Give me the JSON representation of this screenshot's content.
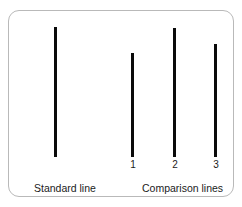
{
  "card": {
    "background_color": "#ffffff",
    "border_color": "#b9b9b9",
    "line_color": "#0a0a0a"
  },
  "standard": {
    "caption": "Standard line",
    "line": {
      "x": 53,
      "top": 26,
      "bottom": 156,
      "height": 130
    }
  },
  "comparison": {
    "caption": "Comparison lines",
    "lines": [
      {
        "label": "1",
        "x": 130,
        "top": 52,
        "bottom": 156,
        "height": 104
      },
      {
        "label": "2",
        "x": 172,
        "top": 27,
        "bottom": 156,
        "height": 129
      },
      {
        "label": "3",
        "x": 213,
        "top": 43,
        "bottom": 156,
        "height": 113
      }
    ]
  },
  "chart_data": {
    "type": "bar",
    "title": "",
    "xlabel": "",
    "ylabel": "Line length (px)",
    "categories": [
      "Standard line",
      "1",
      "2",
      "3"
    ],
    "values": [
      130,
      104,
      129,
      113
    ],
    "series": [
      {
        "name": "Line length",
        "values": [
          130,
          104,
          129,
          113
        ]
      }
    ],
    "annotations": [
      "Standard line",
      "Comparison lines"
    ],
    "grid": false,
    "legend": "none",
    "ylim": [
      0,
      140
    ]
  }
}
